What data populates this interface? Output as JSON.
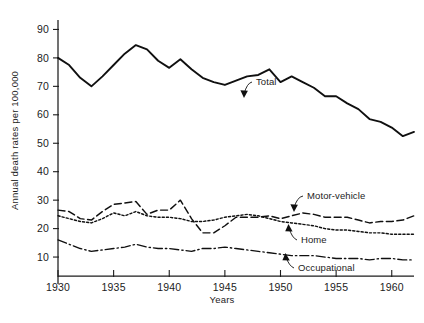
{
  "chart_data": {
    "type": "line",
    "title": "",
    "xlabel": "Years",
    "ylabel": "Annual death rates per 100,000",
    "xlim": [
      1930,
      1962
    ],
    "ylim": [
      0,
      95
    ],
    "grid": false,
    "legend_position": "inline-annotations",
    "x": [
      1930,
      1931,
      1932,
      1933,
      1934,
      1935,
      1936,
      1937,
      1938,
      1939,
      1940,
      1941,
      1942,
      1943,
      1944,
      1945,
      1946,
      1947,
      1948,
      1949,
      1950,
      1951,
      1952,
      1953,
      1954,
      1955,
      1956,
      1957,
      1958,
      1959,
      1960,
      1961,
      1962
    ],
    "xticks": [
      1930,
      1935,
      1940,
      1945,
      1950,
      1955,
      1960
    ],
    "xticklabels": [
      "1930",
      "1935",
      "1940",
      "1945",
      "1950",
      "1955",
      "1960"
    ],
    "yticks": [
      10,
      20,
      30,
      40,
      50,
      60,
      70,
      80,
      90
    ],
    "yticklabels": [
      "10",
      "20",
      "30",
      "40",
      "50",
      "60",
      "70",
      "80",
      "90"
    ],
    "series": [
      {
        "name": "Total",
        "style": "solid",
        "label_text": "Total",
        "values": [
          80.0,
          77.5,
          73.0,
          70.0,
          73.5,
          77.5,
          81.5,
          84.5,
          83.0,
          79.0,
          76.5,
          79.5,
          76.0,
          73.0,
          71.5,
          70.5,
          72.0,
          73.5,
          74.0,
          76.0,
          71.5,
          73.5,
          71.5,
          69.5,
          66.5,
          66.5,
          64.0,
          62.0,
          58.5,
          57.5,
          55.5,
          52.5,
          54.0
        ]
      },
      {
        "name": "Motor-vehicle",
        "style": "long-dash",
        "label_text": "Motor-vehicle",
        "values": [
          26.5,
          26.0,
          23.5,
          23.0,
          26.0,
          28.5,
          29.0,
          29.5,
          25.0,
          26.5,
          26.5,
          30.0,
          23.5,
          18.5,
          18.5,
          21.0,
          24.0,
          24.0,
          24.0,
          24.5,
          23.5,
          24.5,
          25.5,
          25.0,
          24.0,
          24.0,
          24.0,
          23.0,
          22.0,
          22.5,
          22.5,
          23.0,
          24.5
        ]
      },
      {
        "name": "Home",
        "style": "dotted",
        "label_text": "Home",
        "values": [
          24.5,
          23.5,
          22.5,
          22.0,
          23.5,
          25.5,
          24.5,
          26.0,
          24.5,
          24.0,
          24.0,
          23.5,
          22.5,
          22.5,
          23.0,
          24.0,
          24.5,
          25.0,
          24.5,
          23.5,
          22.5,
          22.0,
          21.5,
          21.0,
          20.0,
          19.5,
          19.5,
          19.0,
          18.5,
          18.5,
          18.0,
          18.0,
          18.0
        ]
      },
      {
        "name": "Occupational",
        "style": "dash-dot",
        "label_text": "Occupational",
        "values": [
          16.0,
          14.5,
          13.0,
          12.0,
          12.5,
          13.0,
          13.5,
          14.5,
          13.5,
          13.0,
          13.0,
          12.5,
          12.0,
          13.0,
          13.0,
          13.5,
          13.0,
          12.5,
          12.0,
          11.5,
          11.0,
          10.5,
          10.5,
          10.5,
          10.0,
          9.5,
          9.5,
          9.5,
          9.0,
          9.5,
          9.5,
          9.0,
          9.0
        ]
      }
    ]
  },
  "colors": {
    "ink": "#101010",
    "axis": "#1c1c1c",
    "background": "#ffffff"
  }
}
